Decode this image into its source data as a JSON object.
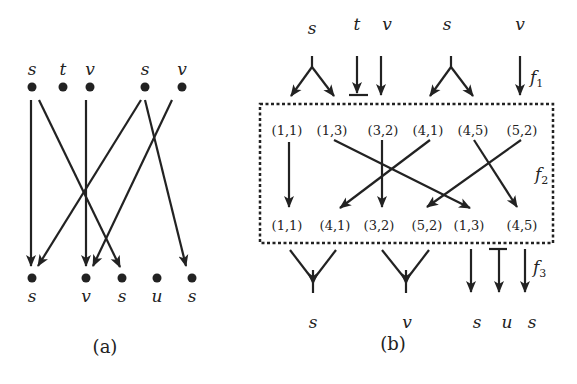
{
  "panel_a": {
    "caption": "(a)",
    "top_nodes": [
      {
        "label": "s",
        "x": 32,
        "y": 87
      },
      {
        "label": "t",
        "x": 63,
        "y": 87
      },
      {
        "label": "v",
        "x": 90,
        "y": 87
      },
      {
        "label": "s",
        "x": 145,
        "y": 87
      },
      {
        "label": "v",
        "x": 182,
        "y": 87
      }
    ],
    "bottom_nodes": [
      {
        "label": "s",
        "x": 32,
        "y": 278
      },
      {
        "label": "v",
        "x": 86,
        "y": 278
      },
      {
        "label": "s",
        "x": 122,
        "y": 278
      },
      {
        "label": "u",
        "x": 157,
        "y": 278
      },
      {
        "label": "s",
        "x": 192,
        "y": 278
      }
    ],
    "edges": [
      {
        "from": 0,
        "to": 0
      },
      {
        "from": 0,
        "to": 2
      },
      {
        "from": 2,
        "to": 1
      },
      {
        "from": 3,
        "to": 0
      },
      {
        "from": 3,
        "to": 4
      },
      {
        "from": 4,
        "to": 1
      }
    ]
  },
  "panel_b": {
    "caption": "(b)",
    "top_labels": [
      "s",
      "t",
      "v",
      "s",
      "v"
    ],
    "bottom_labels": [
      "s",
      "v",
      "s",
      "u",
      "s"
    ],
    "top_pairs": [
      "(1,1)",
      "(1,3)",
      "(3,2)",
      "(4,1)",
      "(4,5)",
      "(5,2)"
    ],
    "bottom_pairs": [
      "(1,1)",
      "(4,1)",
      "(3,2)",
      "(5,2)",
      "(1,3)",
      "(4,5)"
    ],
    "functions": {
      "f1": {
        "name": "f",
        "sub": "1"
      },
      "f2": {
        "name": "f",
        "sub": "2"
      },
      "f3": {
        "name": "f",
        "sub": "3"
      }
    },
    "permutation": [
      {
        "from": "(1,1)",
        "to": "(1,1)"
      },
      {
        "from": "(1,3)",
        "to": "(1,3)"
      },
      {
        "from": "(3,2)",
        "to": "(3,2)"
      },
      {
        "from": "(4,1)",
        "to": "(4,1)"
      },
      {
        "from": "(4,5)",
        "to": "(4,5)"
      },
      {
        "from": "(5,2)",
        "to": "(5,2)"
      }
    ]
  }
}
